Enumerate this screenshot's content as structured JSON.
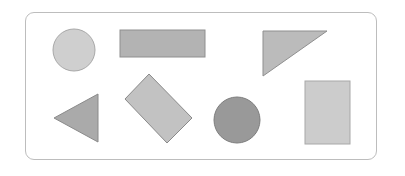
{
  "diagram": {
    "frame": {
      "border_color": "#bdbdbd"
    },
    "shapes": [
      {
        "id": "circle-light",
        "type": "circle",
        "cx": 74,
        "cy": 50,
        "r": 21,
        "fill": "#cfcfcf",
        "stroke": "#a8a8a8"
      },
      {
        "id": "rect-horizontal",
        "type": "rect",
        "x": 120,
        "y": 30,
        "w": 85,
        "h": 27,
        "fill": "#b3b3b3",
        "stroke": "#8f8f8f"
      },
      {
        "id": "triangle-right-angle",
        "type": "polygon",
        "points": "263,31 327,31 263,76",
        "fill": "#bbbbbb",
        "stroke": "#8f8f8f"
      },
      {
        "id": "triangle-left-pointing",
        "type": "polygon",
        "points": "54,118 98,94 98,142",
        "fill": "#aaaaaa",
        "stroke": "#8a8a8a"
      },
      {
        "id": "rect-rotated",
        "type": "polygon",
        "points": "149,74 192,118 167,143 125,99",
        "fill": "#c2c2c2",
        "stroke": "#8a8a8a"
      },
      {
        "id": "circle-dark",
        "type": "circle",
        "cx": 237,
        "cy": 120,
        "r": 23,
        "fill": "#999999",
        "stroke": "#7d7d7d"
      },
      {
        "id": "rect-vertical",
        "type": "rect",
        "x": 305,
        "y": 81,
        "w": 45,
        "h": 63,
        "fill": "#cccccc",
        "stroke": "#a8a8a8"
      }
    ]
  }
}
